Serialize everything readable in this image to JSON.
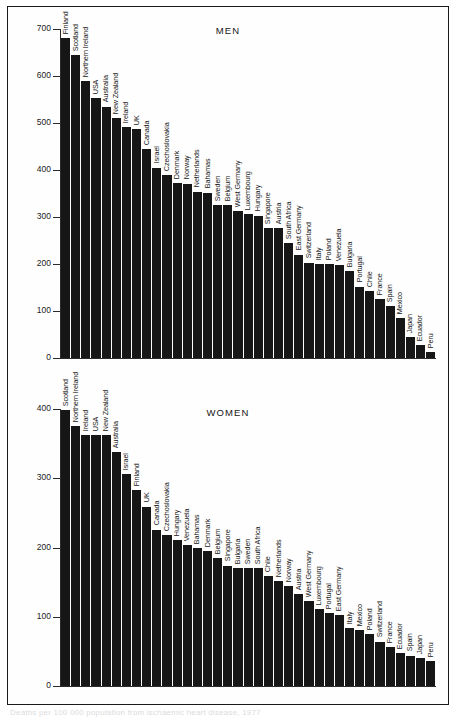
{
  "page": {
    "caption": "Deaths per 100 000 population from ischaemic heart disease, 1977"
  },
  "chart_data": [
    {
      "type": "bar",
      "title": "MEN",
      "xlabel": "",
      "ylabel": "",
      "ylim": [
        0,
        700
      ],
      "yticks": [
        0,
        100,
        200,
        300,
        400,
        500,
        600,
        700
      ],
      "grid": false,
      "legend": "none",
      "categories": [
        "Finland",
        "Scotland",
        "Northern Ireland",
        "USA",
        "Australia",
        "New Zealand",
        "Ireland",
        "UK",
        "Canada",
        "Israel",
        "Czechoslovakia",
        "Denmark",
        "Norway",
        "Netherlands",
        "Bahamas",
        "Sweden",
        "Belgium",
        "West Germany",
        "Luxembourg",
        "Hungary",
        "Singapore",
        "Austria",
        "South Africa",
        "East Germany",
        "Switzerland",
        "Italy",
        "Poland",
        "Venezuela",
        "Bulgaria",
        "Portugal",
        "Chile",
        "France",
        "Spain",
        "Mexico",
        "Japan",
        "Ecuador",
        "Peru"
      ],
      "values": [
        680,
        645,
        590,
        553,
        535,
        510,
        492,
        487,
        445,
        405,
        390,
        372,
        371,
        354,
        352,
        326,
        325,
        313,
        306,
        303,
        277,
        277,
        245,
        220,
        203,
        199,
        199,
        198,
        185,
        152,
        142,
        125,
        110,
        85,
        45,
        28,
        12
      ]
    },
    {
      "type": "bar",
      "title": "WOMEN",
      "xlabel": "",
      "ylabel": "",
      "ylim": [
        0,
        400
      ],
      "yticks": [
        0,
        100,
        200,
        300,
        400
      ],
      "grid": false,
      "legend": "none",
      "categories": [
        "Scotland",
        "Northern Ireland",
        "Ireland",
        "USA",
        "New Zealand",
        "Australia",
        "Israel",
        "Finland",
        "UK",
        "Canada",
        "Czechoslovakia",
        "Hungary",
        "Venezuela",
        "Bahamas",
        "Denmark",
        "Belgium",
        "Singapore",
        "Bulgaria",
        "Sweden",
        "South Africa",
        "Chile",
        "Netherlands",
        "Norway",
        "Austria",
        "West Germany",
        "Luxembourg",
        "Portugal",
        "East Germany",
        "Italy",
        "Mexico",
        "Poland",
        "Switzerland",
        "France",
        "Ecuador",
        "Spain",
        "Japan",
        "Peru"
      ],
      "values": [
        399,
        375,
        362,
        362,
        362,
        338,
        306,
        283,
        259,
        226,
        218,
        211,
        204,
        199,
        195,
        185,
        174,
        170,
        170,
        170,
        159,
        151,
        144,
        133,
        123,
        111,
        105,
        102,
        84,
        81,
        75,
        64,
        56,
        47,
        44,
        40,
        36
      ]
    }
  ]
}
